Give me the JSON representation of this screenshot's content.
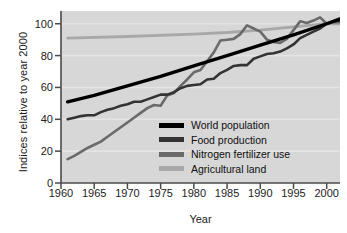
{
  "chart_data": {
    "type": "line",
    "title": "",
    "xlabel": "Year",
    "ylabel": "Indices relative to year 2000",
    "xlim": [
      1960,
      2002
    ],
    "ylim": [
      0,
      108
    ],
    "xticks": [
      1960,
      1965,
      1970,
      1975,
      1980,
      1985,
      1990,
      1995,
      2000
    ],
    "yticks": [
      0,
      20,
      40,
      60,
      80,
      100
    ],
    "grid": "horizontal-faint",
    "legend_position": "inside-center-lower",
    "plot_background": "#d7d7d7",
    "series": [
      {
        "name": "World population",
        "color": "#000000",
        "width": 3.4,
        "x": [
          1961,
          1965,
          1970,
          1975,
          1980,
          1985,
          1990,
          1995,
          2000,
          2002
        ],
        "values": [
          51,
          55,
          61,
          67,
          73.5,
          80,
          86.5,
          93,
          100,
          103
        ]
      },
      {
        "name": "Food production",
        "color": "#333333",
        "width": 2.6,
        "x": [
          1961,
          1962,
          1963,
          1964,
          1965,
          1966,
          1967,
          1968,
          1969,
          1970,
          1971,
          1972,
          1973,
          1974,
          1975,
          1976,
          1977,
          1978,
          1979,
          1980,
          1981,
          1982,
          1983,
          1984,
          1985,
          1986,
          1987,
          1988,
          1989,
          1990,
          1991,
          1992,
          1993,
          1994,
          1995,
          1996,
          1997,
          1998,
          1999,
          2000,
          2001,
          2002
        ],
        "values": [
          40,
          41,
          42,
          42.5,
          42.5,
          44.5,
          46,
          47,
          48.5,
          49.5,
          51,
          51,
          52.5,
          54,
          55.5,
          55.5,
          57,
          59.5,
          61,
          61.5,
          62,
          65,
          65.5,
          69,
          71,
          73.5,
          74,
          74,
          78,
          79.5,
          81,
          81.5,
          82.5,
          84.5,
          87,
          91,
          93,
          95,
          97,
          100,
          101.5,
          102
        ]
      },
      {
        "name": "Nitrogen fertilizer use",
        "color": "#6a6a6a",
        "width": 2.6,
        "x": [
          1961,
          1962,
          1963,
          1964,
          1965,
          1966,
          1967,
          1968,
          1969,
          1970,
          1971,
          1972,
          1973,
          1974,
          1975,
          1976,
          1977,
          1978,
          1979,
          1980,
          1981,
          1982,
          1983,
          1984,
          1985,
          1986,
          1987,
          1988,
          1989,
          1990,
          1991,
          1992,
          1993,
          1994,
          1995,
          1996,
          1997,
          1998,
          1999,
          2000,
          2001,
          2002
        ],
        "values": [
          15,
          17,
          19.5,
          22,
          24,
          26,
          29,
          32,
          35,
          38,
          41,
          44,
          47,
          49,
          48.5,
          55,
          56.5,
          61,
          65,
          69.5,
          71,
          76.5,
          82,
          89.5,
          90,
          90.5,
          93.5,
          99,
          97,
          95,
          90,
          88.5,
          88,
          90.5,
          96,
          101.5,
          100.5,
          102,
          104,
          100,
          101,
          101
        ]
      },
      {
        "name": "Agricultural land",
        "color": "#a8a8a8",
        "width": 2.8,
        "x": [
          1961,
          1970,
          1980,
          1985,
          1990,
          1995,
          2000,
          2002
        ],
        "values": [
          91,
          92,
          93.5,
          94.5,
          96,
          98,
          100,
          100
        ]
      }
    ]
  },
  "axis": {
    "y_title": "Indices relative to year 2000",
    "x_title": "Year",
    "yticks": [
      "0",
      "20",
      "40",
      "60",
      "80",
      "100"
    ],
    "xticks": [
      "1960",
      "1965",
      "1970",
      "1975",
      "1980",
      "1985",
      "1990",
      "1995",
      "2000"
    ]
  },
  "legend": {
    "items": [
      {
        "label": "World population",
        "color": "#000000"
      },
      {
        "label": "Food production",
        "color": "#333333"
      },
      {
        "label": "Nitrogen fertilizer use",
        "color": "#6a6a6a"
      },
      {
        "label": "Agricultural land",
        "color": "#a8a8a8"
      }
    ]
  }
}
